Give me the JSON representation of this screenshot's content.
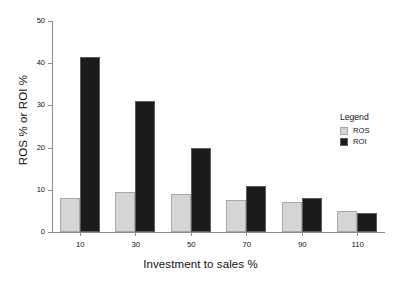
{
  "chart_data": {
    "type": "bar",
    "title": "",
    "subtitle": "",
    "xlabel": "Investment to sales %",
    "ylabel": "ROS % or ROI %",
    "categories": [
      "10",
      "30",
      "50",
      "70",
      "90",
      "110"
    ],
    "series": [
      {
        "name": "ROS",
        "color": "#d5d5d5",
        "values": [
          8,
          9.5,
          9,
          7.5,
          7,
          5
        ]
      },
      {
        "name": "ROI",
        "color": "#1b1b1b",
        "values": [
          41.5,
          31,
          20,
          11,
          8,
          4.5
        ]
      }
    ],
    "ylim": [
      0,
      50
    ],
    "ytick_values": [
      0,
      10,
      20,
      30,
      40,
      50
    ],
    "ytick_labels": [
      "0",
      "10",
      "20",
      "30",
      "40",
      "50"
    ],
    "grid": false,
    "legend": {
      "title": "Legend",
      "position": "right",
      "entries": [
        {
          "label": "ROS",
          "color": "#d5d5d5"
        },
        {
          "label": "ROI",
          "color": "#1b1b1b"
        }
      ]
    },
    "axis_color": "#8e8e8e",
    "background": "#ffffff"
  }
}
